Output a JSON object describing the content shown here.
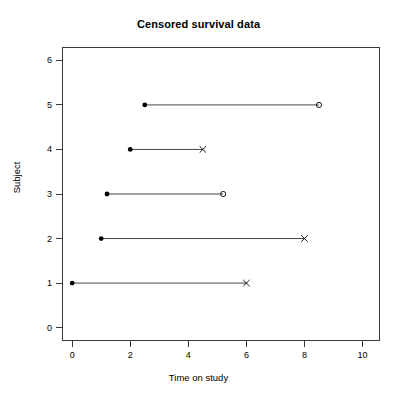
{
  "chart_data": {
    "type": "line",
    "title": "Censored survival data",
    "xlabel": "Time on study",
    "ylabel": "Subject",
    "xlim": [
      -0.35,
      10.6
    ],
    "ylim": [
      -0.3,
      6.3
    ],
    "xticks": [
      0,
      2,
      4,
      6,
      8,
      10
    ],
    "xtick_labels": [
      "0",
      "2",
      "4",
      "6",
      "8",
      "10"
    ],
    "yticks": [
      0,
      1,
      2,
      3,
      4,
      5,
      6
    ],
    "ytick_labels": [
      "0",
      "1",
      "2",
      "3",
      "4",
      "5",
      "6"
    ],
    "grid": false,
    "legend": "none",
    "line_color": "#333333",
    "marker_color": "#000000",
    "series": [
      {
        "name": "Subject 1",
        "subject": 1,
        "entry_time": 0.0,
        "exit_time": 6.0,
        "status": "event",
        "start_marker": "filled-circle",
        "end_marker": "cross"
      },
      {
        "name": "Subject 2",
        "subject": 2,
        "entry_time": 1.0,
        "exit_time": 8.0,
        "status": "event",
        "start_marker": "filled-circle",
        "end_marker": "cross"
      },
      {
        "name": "Subject 3",
        "subject": 3,
        "entry_time": 1.2,
        "exit_time": 5.2,
        "status": "censored",
        "start_marker": "filled-circle",
        "end_marker": "open-circle"
      },
      {
        "name": "Subject 4",
        "subject": 4,
        "entry_time": 2.0,
        "exit_time": 4.5,
        "status": "event",
        "start_marker": "filled-circle",
        "end_marker": "cross"
      },
      {
        "name": "Subject 5",
        "subject": 5,
        "entry_time": 2.5,
        "exit_time": 8.5,
        "status": "censored",
        "start_marker": "filled-circle",
        "end_marker": "open-circle"
      }
    ]
  }
}
